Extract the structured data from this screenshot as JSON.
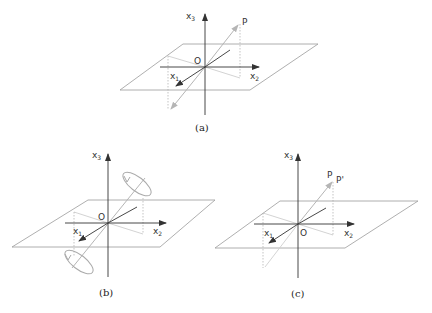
{
  "colors": {
    "axis": "#333333",
    "plane": "#9a9a9a",
    "vector": "#b5b5b5",
    "projection": "#c4c4c4",
    "dotted": "#aaaaaa",
    "text": "#333333"
  },
  "labels": {
    "x1": "x",
    "x1_sub": "1",
    "x2": "x",
    "x2_sub": "2",
    "x3": "x",
    "x3_sub": "3",
    "origin": "O",
    "point_p": "P",
    "point_p_prime": "P'"
  },
  "panels": [
    {
      "id": "a",
      "caption": "(a)",
      "origin": [
        205,
        67
      ],
      "description": "Point P and its inversion through origin O"
    },
    {
      "id": "b",
      "caption": "(b)",
      "origin": [
        108,
        223
      ],
      "description": "Rotation arrows (circular) around an axis through origin"
    },
    {
      "id": "c",
      "caption": "(c)",
      "origin": [
        298,
        224
      ],
      "description": "Point P and nearby point P'"
    }
  ]
}
